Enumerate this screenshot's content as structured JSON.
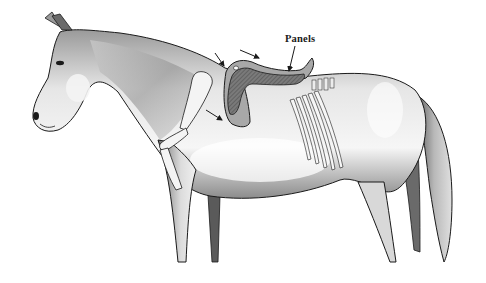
{
  "figure": {
    "labels": [
      {
        "id": "panels",
        "text": "Panels",
        "x": 285,
        "y": 33
      }
    ],
    "arrows_count": 4,
    "colors": {
      "background": "#ffffff",
      "outline": "#1a1a1a",
      "body_shade": "#c8c8c8",
      "body_light": "#f2f2f2",
      "saddle_panel": "#6e6e6e",
      "saddle_flap": "#a8a8a8",
      "bone": "#f4f4f4"
    }
  }
}
